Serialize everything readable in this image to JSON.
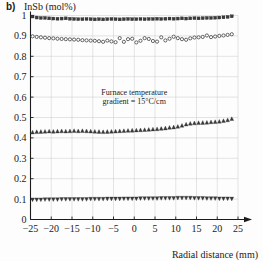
{
  "panel": {
    "label": "b)",
    "y_axis_title": "InSb (mol%)",
    "x_axis_title": "Radial distance (mm)"
  },
  "annotation": {
    "line1": "Furnace temperature",
    "line2": "gradient = 15°C/cm"
  },
  "colors": {
    "marker": "#3a3a3a",
    "marker_open_fill": "#ffffff",
    "grid": "#c9c9c9",
    "axis": "#1b1b1b",
    "background": "#fdfdfd"
  },
  "chart_data": {
    "type": "scatter",
    "title": "InSb (mol%)",
    "xlabel": "Radial distance (mm)",
    "ylabel": "InSb (mol%)",
    "xlim": [
      -25,
      25
    ],
    "ylim": [
      0,
      1
    ],
    "grid": true,
    "legend": "none",
    "xticks": [
      -25,
      -20,
      -15,
      -10,
      -5,
      0,
      5,
      10,
      15,
      20,
      25
    ],
    "yticks": [
      0,
      0.1,
      0.2,
      0.3,
      0.4,
      0.5,
      0.6,
      0.7,
      0.8,
      0.9,
      1
    ],
    "xtick_labels": [
      "−25",
      "−20",
      "−15",
      "−10",
      "−5",
      "0",
      "5",
      "10",
      "15",
      "20",
      "25"
    ],
    "ytick_labels": [
      "0",
      "0.1",
      "0.2",
      "0.3",
      "0.4",
      "0.5",
      "0.6",
      "0.7",
      "0.8",
      "0.9",
      "1"
    ],
    "annotations": [
      {
        "text": "Furnace temperature",
        "x": 0,
        "y": 0.61
      },
      {
        "text": "gradient = 15°C/cm",
        "x": 0,
        "y": 0.565
      }
    ],
    "x": [
      -24.5,
      -23.5,
      -22.5,
      -21.5,
      -20.5,
      -19.5,
      -18.5,
      -17.5,
      -16.5,
      -15.5,
      -14.5,
      -13.5,
      -12.5,
      -11.5,
      -10.5,
      -9.5,
      -8.5,
      -7.5,
      -6.5,
      -5.5,
      -4.5,
      -3.5,
      -2.5,
      -1.5,
      -0.5,
      0.5,
      1.5,
      2.5,
      3.5,
      4.5,
      5.5,
      6.5,
      7.5,
      8.5,
      9.5,
      10.5,
      11.5,
      12.5,
      13.5,
      14.5,
      15.5,
      16.5,
      17.5,
      18.5,
      19.5,
      20.5,
      21.5,
      22.5,
      23.5
    ],
    "series": [
      {
        "name": "upper-squares",
        "marker": "square",
        "fill": "solid",
        "values": [
          0.995,
          0.99,
          0.988,
          0.988,
          0.986,
          0.985,
          0.984,
          0.985,
          0.986,
          0.984,
          0.983,
          0.982,
          0.982,
          0.983,
          0.982,
          0.981,
          0.982,
          0.981,
          0.982,
          0.983,
          0.982,
          0.981,
          0.982,
          0.983,
          0.982,
          0.982,
          0.983,
          0.982,
          0.983,
          0.983,
          0.984,
          0.983,
          0.984,
          0.985,
          0.984,
          0.985,
          0.986,
          0.985,
          0.986,
          0.987,
          0.986,
          0.987,
          0.988,
          0.988,
          0.989,
          0.99,
          0.991,
          0.993,
          0.996
        ]
      },
      {
        "name": "second-open-circles",
        "marker": "circle",
        "fill": "open",
        "values": [
          0.898,
          0.895,
          0.893,
          0.891,
          0.889,
          0.888,
          0.886,
          0.885,
          0.884,
          0.883,
          0.882,
          0.881,
          0.879,
          0.878,
          0.877,
          0.876,
          0.874,
          0.871,
          0.877,
          0.873,
          0.869,
          0.889,
          0.871,
          0.884,
          0.886,
          0.868,
          0.876,
          0.889,
          0.885,
          0.875,
          0.872,
          0.893,
          0.878,
          0.886,
          0.896,
          0.889,
          0.884,
          0.881,
          0.888,
          0.892,
          0.893,
          0.895,
          0.902,
          0.894,
          0.897,
          0.9,
          0.902,
          0.905,
          0.908
        ]
      },
      {
        "name": "third-up-triangles",
        "marker": "triangle-up",
        "fill": "solid",
        "values": [
          0.427,
          0.429,
          0.43,
          0.431,
          0.432,
          0.431,
          0.432,
          0.433,
          0.432,
          0.433,
          0.434,
          0.433,
          0.434,
          0.433,
          0.432,
          0.431,
          0.43,
          0.429,
          0.43,
          0.431,
          0.432,
          0.433,
          0.434,
          0.435,
          0.436,
          0.437,
          0.438,
          0.439,
          0.44,
          0.442,
          0.443,
          0.445,
          0.447,
          0.45,
          0.452,
          0.455,
          0.46,
          0.466,
          0.47,
          0.472,
          0.473,
          0.474,
          0.475,
          0.477,
          0.478,
          0.48,
          0.483,
          0.487,
          0.493
        ]
      },
      {
        "name": "bottom-down-triangles",
        "marker": "triangle-down",
        "fill": "solid",
        "values": [
          0.098,
          0.098,
          0.098,
          0.099,
          0.099,
          0.099,
          0.099,
          0.1,
          0.1,
          0.1,
          0.1,
          0.1,
          0.1,
          0.1,
          0.101,
          0.101,
          0.101,
          0.101,
          0.102,
          0.102,
          0.102,
          0.102,
          0.103,
          0.103,
          0.103,
          0.103,
          0.104,
          0.104,
          0.104,
          0.104,
          0.104,
          0.105,
          0.105,
          0.105,
          0.105,
          0.106,
          0.106,
          0.106,
          0.106,
          0.105,
          0.105,
          0.105,
          0.104,
          0.104,
          0.104,
          0.103,
          0.103,
          0.103,
          0.102
        ]
      }
    ]
  }
}
